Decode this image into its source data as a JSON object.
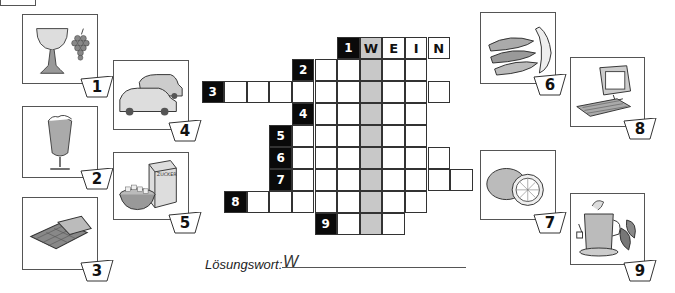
{
  "page": {
    "solution_label": "Lösungswort:",
    "solution_value": "W"
  },
  "pictures": [
    {
      "number": "1",
      "subject": "wine-glass-and-grapes",
      "x": 22,
      "y": 14,
      "w": 76,
      "h": 70,
      "tag_x": 80,
      "tag_y": 76
    },
    {
      "number": "2",
      "subject": "sparkling-wine-glass",
      "x": 22,
      "y": 106,
      "w": 76,
      "h": 72,
      "tag_x": 80,
      "tag_y": 168
    },
    {
      "number": "3",
      "subject": "chocolate-bar",
      "x": 22,
      "y": 197,
      "w": 76,
      "h": 73,
      "tag_x": 80,
      "tag_y": 260
    },
    {
      "number": "4",
      "subject": "cars",
      "x": 113,
      "y": 60,
      "w": 76,
      "h": 70,
      "tag_x": 168,
      "tag_y": 120
    },
    {
      "number": "5",
      "subject": "sugar-box-and-bowl",
      "x": 113,
      "y": 152,
      "w": 76,
      "h": 68,
      "tag_x": 168,
      "tag_y": 212
    },
    {
      "number": "6",
      "subject": "bananas",
      "x": 480,
      "y": 12,
      "w": 76,
      "h": 72,
      "tag_x": 533,
      "tag_y": 74
    },
    {
      "number": "7",
      "subject": "lemon",
      "x": 480,
      "y": 150,
      "w": 76,
      "h": 70,
      "tag_x": 533,
      "tag_y": 212
    },
    {
      "number": "8",
      "subject": "computer",
      "x": 570,
      "y": 57,
      "w": 75,
      "h": 70,
      "tag_x": 623,
      "tag_y": 118
    },
    {
      "number": "9",
      "subject": "tea-glass-and-leaves",
      "x": 570,
      "y": 193,
      "w": 75,
      "h": 72,
      "tag_x": 623,
      "tag_y": 260
    }
  ],
  "crossword": {
    "origin_x": 201.5,
    "origin_y": 37,
    "cell_w": 22.6,
    "cell_h": 22,
    "highlight_col": 7,
    "rows": [
      {
        "number": "1",
        "start_col": 6,
        "length": 4,
        "letters": [
          "W",
          "E",
          "I",
          "N"
        ]
      },
      {
        "number": "2",
        "start_col": 4,
        "length": 5,
        "letters": []
      },
      {
        "number": "3",
        "start_col": 0,
        "length": 10,
        "letters": []
      },
      {
        "number": "4",
        "start_col": 4,
        "length": 5,
        "letters": []
      },
      {
        "number": "5",
        "start_col": 3,
        "length": 6,
        "letters": []
      },
      {
        "number": "6",
        "start_col": 3,
        "length": 7,
        "letters": []
      },
      {
        "number": "7",
        "start_col": 3,
        "length": 8,
        "letters": []
      },
      {
        "number": "8",
        "start_col": 1,
        "length": 8,
        "letters": []
      },
      {
        "number": "9",
        "start_col": 5,
        "length": 3,
        "letters": []
      }
    ]
  },
  "colors": {
    "black_cell": "#0a0a0a",
    "highlight_column": "#c8c8c8",
    "border": "#333333"
  }
}
